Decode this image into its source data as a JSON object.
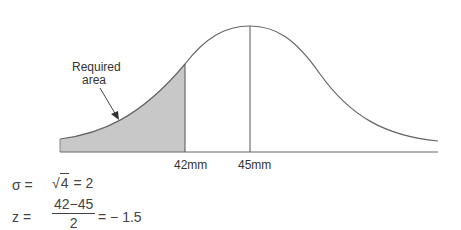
{
  "diagram": {
    "type": "normal-distribution",
    "curve_color": "#666666",
    "shade_color": "#c8c8c8",
    "annotation": {
      "line1": "Required",
      "line2": "area"
    },
    "x_labels": {
      "cutoff": "42mm",
      "mean": "45mm"
    }
  },
  "formulas": {
    "sigma": {
      "lhs": "σ =",
      "sqrt_symbol": "√",
      "radicand": "4",
      "rhs": "= 2"
    },
    "z": {
      "lhs": "z =",
      "numerator": "42−45",
      "denominator": "2",
      "rhs": "= − 1.5"
    }
  }
}
